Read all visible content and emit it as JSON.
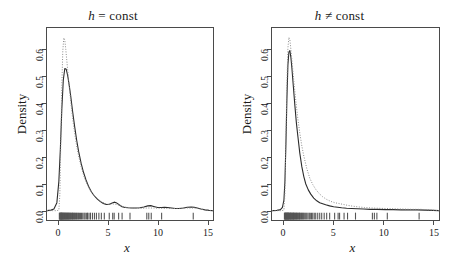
{
  "figure": {
    "width": 453,
    "height": 259,
    "background": "#ffffff",
    "line_color": "#2b2b2b",
    "dotted_color": "#8a8a8a",
    "axis_color": "#4a4a4a"
  },
  "chart_data": [
    {
      "type": "line",
      "panel": "left",
      "title": "h = const",
      "title_parts": {
        "symbol": "h",
        "relation": "=",
        "word": "const"
      },
      "xlabel": "x",
      "ylabel": "Density",
      "xlim": [
        -1.2,
        15.6
      ],
      "ylim": [
        -0.035,
        0.685
      ],
      "xticks": [
        0,
        5,
        10,
        15
      ],
      "xticklabels": [
        "0",
        "5",
        "10",
        "15"
      ],
      "yticks": [
        0.0,
        0.1,
        0.2,
        0.3,
        0.4,
        0.5,
        0.6
      ],
      "yticklabels": [
        "0.0",
        "0.1",
        "0.2",
        "0.3",
        "0.4",
        "0.5",
        "0.6"
      ],
      "grid": false,
      "legend": null,
      "series": [
        {
          "name": "kernel-estimate-solid",
          "style": "solid",
          "x": [
            -1.2,
            -0.8,
            -0.5,
            -0.2,
            0.0,
            0.15,
            0.3,
            0.45,
            0.6,
            0.75,
            0.9,
            1.05,
            1.2,
            1.4,
            1.6,
            1.8,
            2.0,
            2.25,
            2.5,
            2.75,
            3.0,
            3.3,
            3.6,
            3.9,
            4.2,
            4.5,
            4.8,
            5.1,
            5.4,
            5.6,
            5.8,
            6.1,
            6.4,
            6.7,
            7.0,
            7.4,
            7.8,
            8.2,
            8.6,
            9.0,
            9.3,
            9.6,
            10.0,
            10.4,
            10.7,
            11.0,
            11.4,
            11.8,
            12.2,
            12.6,
            13.0,
            13.4,
            13.7,
            14.0,
            14.4,
            14.8,
            15.2,
            15.6
          ],
          "y": [
            0.0,
            0.002,
            0.006,
            0.03,
            0.11,
            0.23,
            0.38,
            0.49,
            0.533,
            0.53,
            0.505,
            0.47,
            0.43,
            0.37,
            0.315,
            0.265,
            0.222,
            0.178,
            0.143,
            0.115,
            0.092,
            0.07,
            0.055,
            0.043,
            0.034,
            0.027,
            0.023,
            0.024,
            0.029,
            0.032,
            0.03,
            0.022,
            0.015,
            0.012,
            0.011,
            0.01,
            0.01,
            0.011,
            0.014,
            0.018,
            0.019,
            0.016,
            0.012,
            0.012,
            0.013,
            0.012,
            0.01,
            0.008,
            0.008,
            0.01,
            0.013,
            0.014,
            0.013,
            0.01,
            0.006,
            0.003,
            0.001,
            0.0
          ]
        },
        {
          "name": "reference-density-dotted",
          "style": "dotted",
          "x": [
            -1.2,
            -0.6,
            -0.2,
            0.0,
            0.1,
            0.2,
            0.3,
            0.4,
            0.5,
            0.6,
            0.7,
            0.85,
            1.0,
            1.2,
            1.4,
            1.6,
            1.8,
            2.0,
            2.3,
            2.6,
            2.9,
            3.2,
            3.5,
            3.9,
            4.3,
            4.7,
            5.1,
            5.5,
            5.9,
            6.3,
            6.8,
            7.3,
            7.8,
            8.4,
            9.0,
            9.6,
            10.2,
            10.9,
            11.6,
            12.3,
            13.0,
            13.7,
            14.4,
            15.0,
            15.6
          ],
          "y": [
            0.0,
            0.0,
            0.0,
            0.002,
            0.06,
            0.26,
            0.47,
            0.6,
            0.648,
            0.64,
            0.605,
            0.545,
            0.485,
            0.41,
            0.345,
            0.29,
            0.243,
            0.205,
            0.158,
            0.122,
            0.095,
            0.075,
            0.06,
            0.045,
            0.034,
            0.027,
            0.024,
            0.025,
            0.023,
            0.018,
            0.013,
            0.01,
            0.009,
            0.009,
            0.01,
            0.01,
            0.009,
            0.008,
            0.008,
            0.009,
            0.01,
            0.01,
            0.006,
            0.002,
            0.0
          ]
        }
      ],
      "rug": {
        "name": "data-rug-marks",
        "values": [
          0.05,
          0.09,
          0.12,
          0.15,
          0.18,
          0.21,
          0.24,
          0.27,
          0.3,
          0.33,
          0.36,
          0.4,
          0.43,
          0.46,
          0.5,
          0.54,
          0.58,
          0.62,
          0.66,
          0.7,
          0.74,
          0.78,
          0.83,
          0.87,
          0.92,
          0.96,
          1.0,
          1.05,
          1.1,
          1.15,
          1.2,
          1.26,
          1.32,
          1.38,
          1.44,
          1.5,
          1.57,
          1.63,
          1.7,
          1.78,
          1.85,
          1.93,
          2.0,
          2.1,
          2.2,
          2.3,
          2.42,
          2.55,
          2.65,
          2.78,
          2.9,
          3.05,
          3.2,
          3.4,
          3.6,
          3.8,
          4.05,
          4.3,
          4.6,
          5.1,
          5.45,
          5.6,
          6.05,
          6.4,
          7.2,
          8.9,
          9.1,
          9.35,
          10.4,
          13.6
        ]
      }
    },
    {
      "type": "line",
      "panel": "right",
      "title": "h ≠ const",
      "title_parts": {
        "symbol": "h",
        "relation": "≠",
        "word": "const"
      },
      "xlabel": "x",
      "ylabel": "Density",
      "xlim": [
        -1.2,
        15.6
      ],
      "ylim": [
        -0.035,
        0.685
      ],
      "xticks": [
        0,
        5,
        10,
        15
      ],
      "xticklabels": [
        "0",
        "5",
        "10",
        "15"
      ],
      "yticks": [
        0.0,
        0.1,
        0.2,
        0.3,
        0.4,
        0.5,
        0.6
      ],
      "yticklabels": [
        "0.0",
        "0.1",
        "0.2",
        "0.3",
        "0.4",
        "0.5",
        "0.6"
      ],
      "grid": false,
      "legend": null,
      "series": [
        {
          "name": "adaptive-kernel-estimate-solid",
          "style": "solid",
          "x": [
            -1.2,
            -0.7,
            -0.35,
            -0.15,
            0.0,
            0.1,
            0.2,
            0.3,
            0.4,
            0.5,
            0.6,
            0.7,
            0.8,
            0.95,
            1.1,
            1.25,
            1.4,
            1.6,
            1.8,
            2.0,
            2.2,
            2.45,
            2.7,
            3.0,
            3.3,
            3.6,
            3.9,
            4.2,
            4.6,
            5.0,
            5.4,
            5.8,
            6.3,
            6.8,
            7.4,
            8.0,
            8.7,
            9.4,
            10.2,
            11.0,
            11.8,
            12.6,
            13.4,
            14.2,
            15.0,
            15.6
          ],
          "y": [
            0.0,
            0.001,
            0.004,
            0.012,
            0.04,
            0.11,
            0.25,
            0.42,
            0.545,
            0.595,
            0.6,
            0.575,
            0.535,
            0.465,
            0.395,
            0.33,
            0.28,
            0.215,
            0.165,
            0.128,
            0.1,
            0.078,
            0.062,
            0.047,
            0.037,
            0.03,
            0.026,
            0.022,
            0.018,
            0.015,
            0.013,
            0.011,
            0.009,
            0.008,
            0.007,
            0.006,
            0.005,
            0.005,
            0.004,
            0.004,
            0.003,
            0.003,
            0.003,
            0.002,
            0.001,
            0.0
          ]
        },
        {
          "name": "reference-density-dotted",
          "style": "dotted",
          "x": [
            -1.2,
            -0.6,
            -0.2,
            0.0,
            0.1,
            0.2,
            0.3,
            0.4,
            0.5,
            0.6,
            0.7,
            0.85,
            1.0,
            1.2,
            1.4,
            1.6,
            1.8,
            2.0,
            2.3,
            2.6,
            2.9,
            3.2,
            3.5,
            3.9,
            4.3,
            4.7,
            5.1,
            5.5,
            5.9,
            6.4,
            6.9,
            7.5,
            8.1,
            8.8,
            9.5,
            10.3,
            11.1,
            12.0,
            12.9,
            13.8,
            14.6,
            15.2,
            15.6
          ],
          "y": [
            0.0,
            0.0,
            0.0,
            0.002,
            0.065,
            0.27,
            0.48,
            0.61,
            0.65,
            0.64,
            0.605,
            0.545,
            0.485,
            0.41,
            0.345,
            0.29,
            0.243,
            0.205,
            0.158,
            0.122,
            0.098,
            0.08,
            0.066,
            0.052,
            0.042,
            0.035,
            0.03,
            0.027,
            0.024,
            0.02,
            0.017,
            0.014,
            0.012,
            0.01,
            0.009,
            0.008,
            0.007,
            0.006,
            0.005,
            0.005,
            0.003,
            0.001,
            0.0
          ]
        }
      ],
      "rug": {
        "name": "data-rug-marks",
        "values": [
          0.05,
          0.09,
          0.12,
          0.15,
          0.18,
          0.21,
          0.24,
          0.27,
          0.3,
          0.33,
          0.36,
          0.4,
          0.43,
          0.46,
          0.5,
          0.54,
          0.58,
          0.62,
          0.66,
          0.7,
          0.74,
          0.78,
          0.83,
          0.87,
          0.92,
          0.96,
          1.0,
          1.05,
          1.1,
          1.15,
          1.2,
          1.26,
          1.32,
          1.38,
          1.44,
          1.5,
          1.57,
          1.63,
          1.7,
          1.78,
          1.85,
          1.93,
          2.0,
          2.1,
          2.2,
          2.3,
          2.42,
          2.55,
          2.65,
          2.78,
          2.9,
          3.05,
          3.2,
          3.4,
          3.6,
          3.8,
          4.05,
          4.3,
          4.6,
          5.1,
          5.45,
          5.6,
          6.05,
          6.4,
          7.2,
          8.9,
          9.1,
          9.35,
          10.4,
          13.6
        ]
      }
    }
  ]
}
